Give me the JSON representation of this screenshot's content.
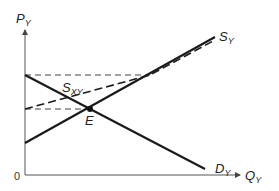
{
  "diagram": {
    "y_axis_label": {
      "main": "P",
      "sub": "Y"
    },
    "x_axis_label": {
      "main": "Q",
      "sub": "Y"
    },
    "origin_label": "0",
    "curves": [
      {
        "id": "supply_y",
        "label": {
          "main": "S",
          "sub": "Y"
        },
        "style": "solid",
        "slope": "upward"
      },
      {
        "id": "demand_y",
        "label": {
          "main": "D",
          "sub": "Y"
        },
        "style": "solid",
        "slope": "downward"
      },
      {
        "id": "supply_xy",
        "label": {
          "main": "S",
          "sub": "XY"
        },
        "style": "dashed",
        "slope": "upward"
      }
    ],
    "equilibrium_label": "E",
    "guide_lines": [
      "horizontal dashed at demand intercept price",
      "horizontal dashed at equilibrium price"
    ],
    "colors": {
      "line": "#1a1a1a",
      "dashed": "#333333",
      "axis": "#555555"
    }
  }
}
